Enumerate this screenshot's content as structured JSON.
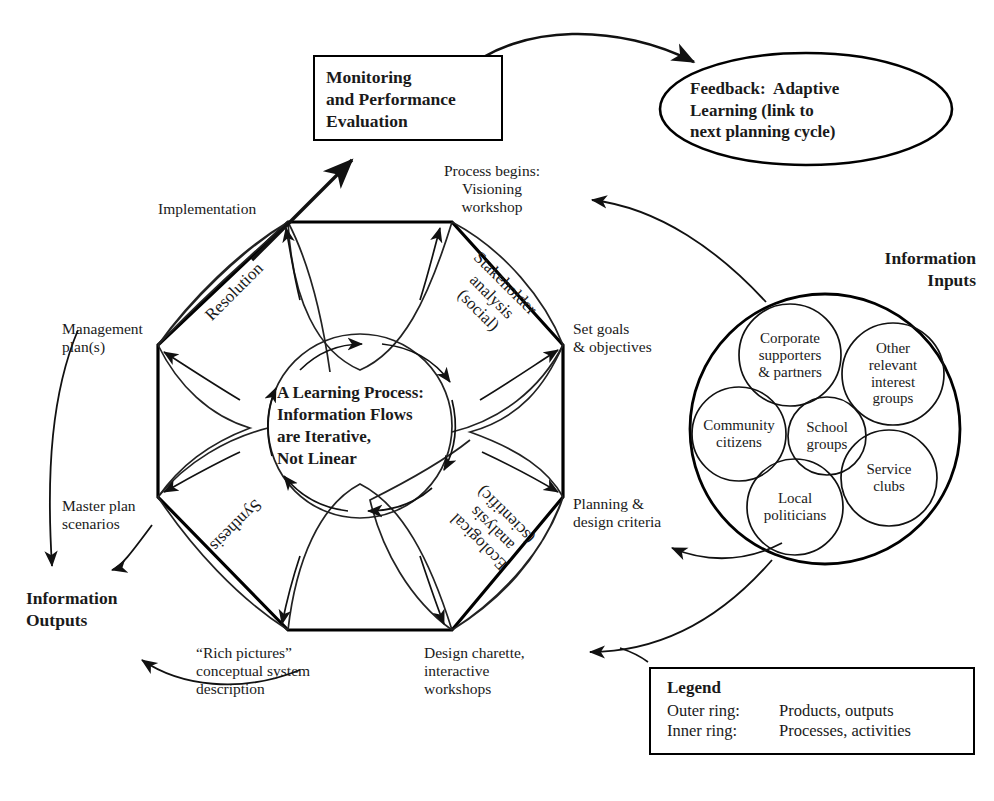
{
  "figure": {
    "kind": "conceptual-process-diagram",
    "caption": ""
  },
  "monitoring_box": {
    "text": "Monitoring\nand Performance\nEvaluation"
  },
  "feedback_ellipse": {
    "text": "Feedback:  Adaptive\nLearning (link to\nnext planning cycle)"
  },
  "center": {
    "text": "A Learning Process:\nInformation Flows\nare Iterative,\nNot Linear"
  },
  "inner_ring": {
    "note": "Processes, activities — rotated labels inside the octagon petals",
    "items": [
      {
        "id": "stakeholder-analysis",
        "label": "Stakeholder\nanalysis\n(social)",
        "rotation": 45
      },
      {
        "id": "ecological-analysis",
        "label": "Ecological\nanalysis\n(scientific)",
        "rotation": 225
      },
      {
        "id": "synthesis",
        "label": "Synthesis",
        "rotation": 135
      },
      {
        "id": "resolution",
        "label": "Resolution",
        "rotation": -45
      }
    ]
  },
  "outer_ring": {
    "note": "Products, outputs — labels placed outside the octagon vertices",
    "items": [
      {
        "id": "process-begins",
        "label": "Process begins:\nVisioning\nworkshop"
      },
      {
        "id": "set-goals",
        "label": "Set goals\n& objectives"
      },
      {
        "id": "planning-design",
        "label": "Planning &\ndesign criteria"
      },
      {
        "id": "design-charette",
        "label": "Design charette,\ninteractive\nworkshops"
      },
      {
        "id": "rich-pictures",
        "label": "“Rich pictures”\nconceptual system\ndescription"
      },
      {
        "id": "master-plan",
        "label": "Master plan\nscenarios"
      },
      {
        "id": "management-plan",
        "label": "Management\nplan(s)"
      },
      {
        "id": "implementation",
        "label": "Implementation"
      }
    ]
  },
  "information_outputs": {
    "title": "Information\nOutputs"
  },
  "information_inputs": {
    "title": "Information\nInputs",
    "groups": [
      {
        "id": "corporate-supporters",
        "label": "Corporate\nsupporters\n& partners"
      },
      {
        "id": "other-relevant-interest-groups",
        "label": "Other\nrelevant\ninterest\ngroups"
      },
      {
        "id": "community-citizens",
        "label": "Community\ncitizens"
      },
      {
        "id": "school-groups",
        "label": "School\ngroups"
      },
      {
        "id": "service-clubs",
        "label": "Service\nclubs"
      },
      {
        "id": "local-politicians",
        "label": "Local\npoliticians"
      }
    ]
  },
  "legend": {
    "title": "Legend",
    "rows": [
      {
        "key": "Outer ring:",
        "value": "Products, outputs"
      },
      {
        "key": "Inner ring:",
        "value": "Processes, activities"
      }
    ]
  },
  "colors": {
    "ink": "#1a1a1a",
    "stroke": "#000000",
    "background": "#ffffff"
  }
}
